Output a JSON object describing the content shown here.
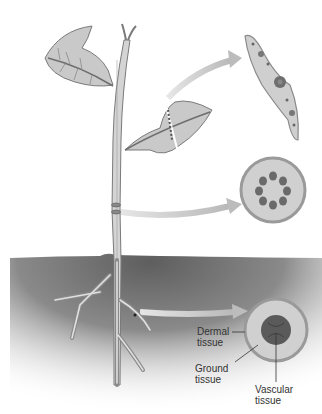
{
  "figure": {
    "parts": [
      {
        "name": "leaf",
        "detail": "leaf-cross-section"
      },
      {
        "name": "stem",
        "detail": "stem-cross-section"
      },
      {
        "name": "root",
        "detail": "root-cross-section"
      }
    ]
  },
  "labels": {
    "dermal": {
      "line1": "Dermal",
      "line2": "tissue"
    },
    "ground": {
      "line1": "Ground",
      "line2": "tissue"
    },
    "vascular": {
      "line1": "Vascular",
      "line2": "tissue"
    }
  },
  "colors": {
    "soil_dark": "#6e6e6e",
    "plant_fill": "#c8c8c8",
    "plant_stroke": "#7a7a7a",
    "vascular": "#5a5a5a",
    "arrow": "#c4c4c4",
    "outer_ring": "#9a9a9a",
    "ground_fill": "#d0d0d0"
  }
}
